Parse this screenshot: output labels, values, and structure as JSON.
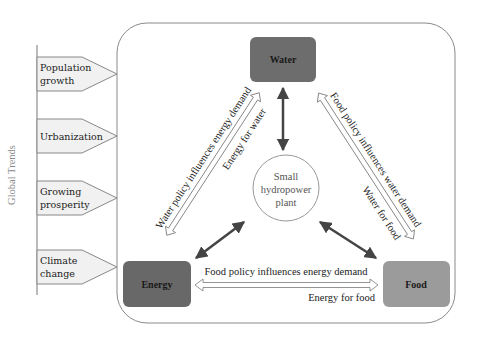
{
  "side_label": "Global Trends",
  "trends": [
    {
      "line1": "Population",
      "line2": "growth"
    },
    {
      "line1": "Urbanization",
      "line2": ""
    },
    {
      "line1": "Growing",
      "line2": "prosperity"
    },
    {
      "line1": "Climate",
      "line2": "change"
    }
  ],
  "nodes": {
    "water": {
      "label": "Water",
      "color": "#6d6d6d"
    },
    "energy": {
      "label": "Energy",
      "color": "#686868"
    },
    "food": {
      "label": "Food",
      "color": "#9b9b9b"
    }
  },
  "hub": {
    "line1": "Small",
    "line2": "hydropower",
    "line3": "plant"
  },
  "links": {
    "water_energy_outer": "Water policy influences energy demand",
    "water_energy_inner": "Energy for water",
    "water_food_outer": "Food policy influences water demand",
    "water_food_inner": "Water for food",
    "energy_food_top": "Food policy influences energy demand",
    "energy_food_bottom": "Energy for food"
  }
}
